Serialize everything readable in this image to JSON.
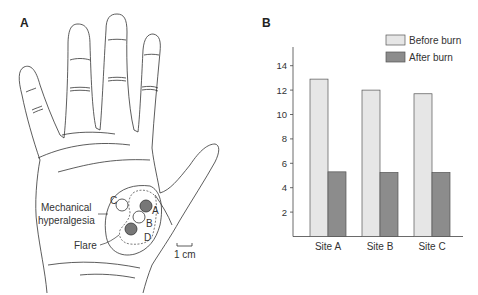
{
  "panel_a": {
    "letter": "A",
    "labels": {
      "mechanical_1": "Mechanical",
      "mechanical_2": "hyperalgesia",
      "flare": "Flare",
      "site_a": "A",
      "site_b": "B",
      "site_c": "C",
      "site_d": "D",
      "scale": "1 cm"
    }
  },
  "panel_b": {
    "letter": "B"
  },
  "chart_data": {
    "type": "bar",
    "title": "",
    "xlabel": "",
    "ylabel": "",
    "categories": [
      "Site A",
      "Site B",
      "Site C"
    ],
    "series": [
      {
        "name": "Before burn",
        "values": [
          12.9,
          12.0,
          11.7
        ],
        "color": "#e6e6e6"
      },
      {
        "name": "After burn",
        "values": [
          5.3,
          5.25,
          5.25
        ],
        "color": "#8c8c8c"
      }
    ],
    "yticks": [
      2,
      4,
      6,
      8,
      10,
      12,
      14
    ],
    "ylim": [
      0,
      15.5
    ],
    "grid": false,
    "legend_position": "top-right"
  }
}
